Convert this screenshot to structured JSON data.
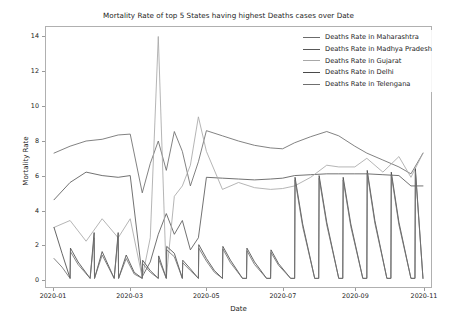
{
  "chart_data": {
    "type": "line",
    "title": "Mortality Rate of top 5 States having highest Deaths cases over Date",
    "xlabel": "Date",
    "ylabel": "Mortality Rate",
    "grid": false,
    "legend_position": "upper right",
    "ylim": [
      -0.45,
      14.6
    ],
    "yticks": [
      0,
      2,
      4,
      6,
      8,
      10,
      12,
      14
    ],
    "ytick_labels": [
      "0",
      "2",
      "4",
      "6",
      "8",
      "10",
      "12",
      "14"
    ],
    "xlim": [
      0,
      48
    ],
    "xticks": [
      1,
      10.5,
      20,
      29.5,
      38.5,
      47
    ],
    "xtick_labels": [
      "2020-01",
      "2020-03",
      "2020-05",
      "2020-07",
      "2020-09",
      "2020-11"
    ],
    "colors": {
      "maharashtra": "#6b6b6b",
      "madhya_pradesh": "#585858",
      "gujarat": "#a8a8a8",
      "delhi": "#4a4a4a",
      "telengana": "#6f6f6f"
    },
    "series": [
      {
        "name": "Deaths Rate in Maharashtra",
        "color": "#6b6b6b",
        "x": [
          1,
          3,
          5,
          7,
          9,
          10.5,
          12,
          13,
          14,
          15,
          16,
          17,
          18,
          19,
          20,
          22,
          24,
          26,
          28,
          29.5,
          31,
          33,
          35,
          36.5,
          38.5,
          40,
          42,
          44,
          45.5,
          47
        ],
        "values": [
          7.3,
          7.7,
          8.0,
          8.1,
          8.35,
          8.4,
          5.0,
          6.7,
          8.0,
          6.3,
          8.55,
          7.4,
          5.4,
          6.8,
          8.6,
          8.3,
          8.0,
          7.75,
          7.6,
          7.55,
          7.9,
          8.25,
          8.55,
          8.3,
          7.7,
          7.3,
          6.9,
          6.5,
          6.1,
          7.3
        ]
      },
      {
        "name": "Deaths Rate in Madhya Pradesh",
        "color": "#585858",
        "x": [
          1,
          3,
          5,
          7,
          9,
          10.5,
          12,
          13,
          14,
          15,
          16,
          17,
          18,
          19,
          20,
          22,
          24,
          26,
          28,
          29.5,
          31,
          33,
          35,
          36.5,
          38.5,
          40,
          42,
          44,
          45.5,
          47
        ],
        "values": [
          4.6,
          5.6,
          6.2,
          6.0,
          5.9,
          6.0,
          0.15,
          1.0,
          2.6,
          3.8,
          2.6,
          3.4,
          1.7,
          2.4,
          5.9,
          5.85,
          5.8,
          5.75,
          5.8,
          5.85,
          6.0,
          6.05,
          6.1,
          6.1,
          6.1,
          6.1,
          6.05,
          6.0,
          5.4,
          5.4
        ]
      },
      {
        "name": "Deaths Rate in Gujarat",
        "color": "#a8a8a8",
        "x": [
          1,
          3,
          5,
          7,
          9,
          10.5,
          12,
          13,
          14,
          15,
          16,
          17,
          18,
          19,
          20,
          22,
          24,
          26,
          28,
          29.5,
          31,
          33,
          35,
          36.5,
          38.5,
          40,
          42,
          44,
          45.5,
          47
        ],
        "values": [
          3.0,
          3.4,
          2.2,
          3.5,
          2.4,
          3.5,
          0.1,
          2.4,
          14.05,
          0.1,
          4.8,
          5.4,
          6.6,
          9.4,
          7.4,
          5.2,
          5.6,
          5.3,
          5.2,
          5.25,
          5.4,
          5.9,
          6.6,
          6.5,
          6.5,
          7.0,
          6.2,
          7.1,
          5.9,
          7.3
        ]
      },
      {
        "name": "Deaths Rate in Delhi",
        "color": "#4a4a4a",
        "x": [
          1,
          2,
          3,
          3.05,
          4,
          5.5,
          6,
          6.05,
          7,
          8.5,
          9,
          9.05,
          10,
          11,
          12,
          12.05,
          13,
          14,
          14.05,
          15,
          15.05,
          16,
          17,
          17.05,
          18,
          19,
          19.05,
          20,
          21,
          22,
          22.05,
          23,
          24.5,
          25,
          25.05,
          26,
          27.5,
          28,
          28.05,
          29,
          30.5,
          31,
          31.05,
          32,
          33.5,
          34,
          34.05,
          35,
          36.5,
          37,
          37.05,
          38,
          39.5,
          40,
          40.05,
          41,
          42.5,
          43,
          43.05,
          44,
          45.5,
          46,
          46.05,
          47
        ],
        "values": [
          3.0,
          1.5,
          0.05,
          1.8,
          1.0,
          0.05,
          2.7,
          0.05,
          1.6,
          0.05,
          2.7,
          0.05,
          1.4,
          0.4,
          0.05,
          1.1,
          0.5,
          0.05,
          1.35,
          0.05,
          1.9,
          1.5,
          0.05,
          1.1,
          0.6,
          0.05,
          2.0,
          1.2,
          0.5,
          0.05,
          1.9,
          1.1,
          0.05,
          0.05,
          1.8,
          1.0,
          0.05,
          0.05,
          1.7,
          0.9,
          0.05,
          0.05,
          5.9,
          3.2,
          0.05,
          0.05,
          6.0,
          3.3,
          0.05,
          0.05,
          5.9,
          3.2,
          0.05,
          0.05,
          6.3,
          3.4,
          0.05,
          0.05,
          6.2,
          3.3,
          0.05,
          0.05,
          6.4,
          0.05
        ]
      },
      {
        "name": "Deaths Rate in Telengana",
        "color": "#6f6f6f",
        "x": [
          1,
          2,
          3,
          3.05,
          4,
          5.5,
          6,
          6.05,
          7,
          8.5,
          9,
          9.05,
          10,
          11,
          12,
          12.05,
          13,
          14,
          14.05,
          15,
          15.05,
          16,
          17,
          17.05,
          18,
          19,
          19.05,
          20,
          21,
          22,
          22.05,
          23,
          24.5,
          25,
          25.05,
          26,
          27.5,
          28,
          28.05,
          29,
          30.5,
          31,
          31.05,
          32,
          33.5,
          34,
          34.05,
          35,
          36.5,
          37,
          37.05,
          38,
          39.5,
          40,
          40.05,
          41,
          42.5,
          43,
          43.05,
          44,
          45.5,
          46,
          46.05,
          47
        ],
        "values": [
          1.2,
          0.7,
          0.05,
          1.6,
          0.85,
          0.05,
          2.4,
          0.05,
          1.4,
          0.05,
          2.5,
          0.05,
          1.2,
          0.3,
          0.05,
          0.9,
          0.4,
          0.05,
          1.15,
          0.05,
          1.7,
          1.3,
          0.05,
          0.95,
          0.5,
          0.05,
          1.8,
          1.05,
          0.4,
          0.05,
          1.75,
          0.95,
          0.05,
          0.05,
          1.65,
          0.85,
          0.05,
          0.05,
          1.55,
          0.8,
          0.05,
          0.05,
          5.75,
          3.05,
          0.05,
          0.05,
          5.85,
          3.15,
          0.05,
          0.05,
          5.75,
          3.05,
          0.05,
          0.05,
          6.15,
          3.25,
          0.05,
          0.05,
          6.05,
          3.15,
          0.05,
          0.05,
          6.25,
          0.05
        ]
      }
    ]
  },
  "legend": {
    "items": [
      {
        "label": "Deaths Rate in Maharashtra"
      },
      {
        "label": "Deaths Rate in Madhya Pradesh"
      },
      {
        "label": "Deaths Rate in Gujarat"
      },
      {
        "label": "Deaths Rate in Delhi"
      },
      {
        "label": "Deaths Rate in Telengana"
      }
    ]
  }
}
